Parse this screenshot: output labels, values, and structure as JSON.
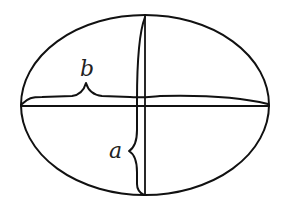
{
  "diagram": {
    "type": "ellipse-axes",
    "colors": {
      "stroke": "#111111",
      "background": "#ffffff",
      "label": "#222222"
    },
    "ellipse": {
      "cx": 145,
      "cy": 105,
      "rx": 124,
      "ry": 90
    },
    "labels": {
      "semi_major": "b",
      "semi_minor": "a"
    }
  }
}
